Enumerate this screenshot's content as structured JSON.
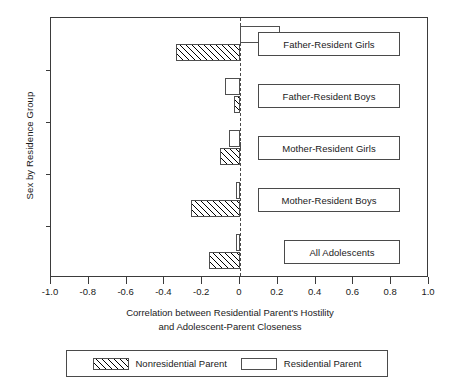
{
  "chart_data": {
    "type": "bar",
    "orientation": "horizontal",
    "title": "",
    "xlabel_line1": "Correlation between Residential Parent's Hostility",
    "xlabel_line2": "and Adolescent-Parent Closeness",
    "ylabel": "Sex by Residence Group",
    "xlim": [
      -1.0,
      1.0
    ],
    "xticks": [
      -1.0,
      -0.8,
      -0.6,
      -0.4,
      -0.2,
      0,
      0.2,
      0.4,
      0.6,
      0.8,
      1.0
    ],
    "xticklabels": [
      "-1.0",
      "-0.8",
      "-0.6",
      "-0.4",
      "-0.2",
      "0",
      "0.2",
      "0.4",
      "0.6",
      "0.8",
      "1.0"
    ],
    "grid": false,
    "zero_reference_line": true,
    "legend_position": "below-axis",
    "categories": [
      "Father-Resident Girls",
      "Father-Resident Boys",
      "Mother-Resident Girls",
      "Mother-Resident Boys",
      "All Adolescents"
    ],
    "series": [
      {
        "name": "Residential Parent",
        "fill": "white",
        "values": [
          0.21,
          -0.08,
          -0.06,
          -0.02,
          -0.02
        ]
      },
      {
        "name": "Nonresidential Parent",
        "fill": "hatched",
        "values": [
          -0.34,
          -0.03,
          -0.105,
          -0.26,
          -0.165
        ]
      }
    ]
  },
  "legend": {
    "entries": [
      {
        "label": "Nonresidential Parent",
        "swatch": "hatched"
      },
      {
        "label": "Residential Parent",
        "swatch": "white"
      }
    ]
  }
}
